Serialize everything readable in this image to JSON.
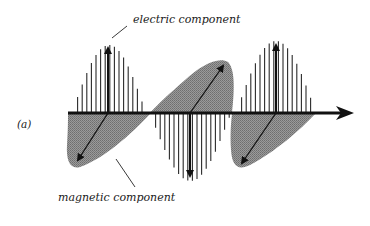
{
  "figure": {
    "panel_label": "(a)",
    "electric_label": "electric component",
    "magnetic_label": "magnetic component",
    "colors": {
      "ink": "#111111",
      "magnetic_fill": "#8c8c8c",
      "electric_hatch": "#2a2a2a",
      "background": "#ffffff"
    },
    "elements": {
      "propagation_axis": "horizontal arrow pointing right",
      "electric_lobes": [
        {
          "direction": "up",
          "peak_x": 108
        },
        {
          "direction": "down",
          "peak_x": 190
        },
        {
          "direction": "up",
          "peak_x": 276
        }
      ],
      "magnetic_lobes": [
        {
          "direction": "down-left",
          "tip": [
            75,
            165
          ]
        },
        {
          "direction": "up-right",
          "tip": [
            226,
            62
          ]
        },
        {
          "direction": "down-left",
          "tip": [
            238,
            168
          ]
        }
      ]
    }
  }
}
